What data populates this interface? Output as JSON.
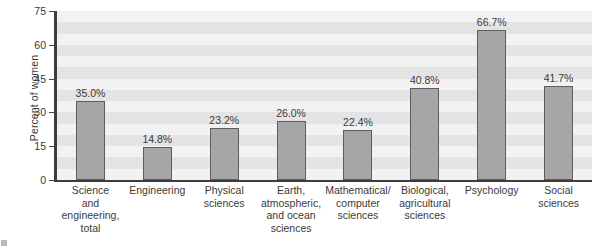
{
  "chart_data": {
    "type": "bar",
    "title": "",
    "xlabel": "",
    "ylabel": "Percent of women",
    "ylim": [
      0,
      75
    ],
    "yticks": [
      0,
      15,
      30,
      45,
      60,
      75
    ],
    "grid": "horizontal-alternating-bands",
    "legend": "none",
    "categories": [
      "Science and engineering, total",
      "Engineering",
      "Physical sciences",
      "Earth, atmospheric, and ocean sciences",
      "Mathematical/ computer sciences",
      "Biological, agricultural sciences",
      "Psychology",
      "Social sciences"
    ],
    "category_lines": [
      [
        "Science",
        "and",
        "engineering,",
        "total"
      ],
      [
        "Engineering"
      ],
      [
        "Physical",
        "sciences"
      ],
      [
        "Earth,",
        "atmospheric,",
        "and ocean",
        "sciences"
      ],
      [
        "Mathematical/",
        "computer",
        "sciences"
      ],
      [
        "Biological,",
        "agricultural",
        "sciences"
      ],
      [
        "Psychology"
      ],
      [
        "Social",
        "sciences"
      ]
    ],
    "values": [
      35.0,
      14.8,
      23.2,
      26.0,
      22.4,
      40.8,
      66.7,
      41.7
    ],
    "value_labels": [
      "35.0%",
      "14.8%",
      "23.2%",
      "26.0%",
      "22.4%",
      "40.8%",
      "66.7%",
      "41.7%"
    ],
    "colors": {
      "bar_fill": "#a6a6a6",
      "bar_stroke": "#5d5d5d",
      "plot_background": "#f2f2f2",
      "band": "#e4e4e4",
      "axis": "#3d3d3d",
      "text": "#3a3a3a"
    }
  }
}
